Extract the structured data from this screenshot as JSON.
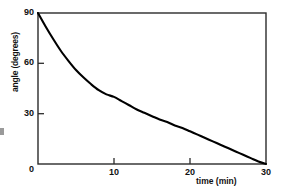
{
  "chart_data": {
    "type": "line",
    "title": "",
    "subtitle": "",
    "xlabel": "time (min)",
    "ylabel": "angle (degrees)",
    "xlim": [
      0,
      30
    ],
    "ylim": [
      0,
      90
    ],
    "xticks": [
      0,
      10,
      20,
      30
    ],
    "xtick_labels": [
      "0",
      "10",
      "20",
      "30"
    ],
    "yticks": [
      0,
      30,
      60,
      90
    ],
    "ytick_labels": [
      "0",
      "30",
      "60",
      "90"
    ],
    "grid": false,
    "legend": null,
    "annotations": [],
    "series": [
      {
        "name": "angle decay",
        "color": "#000000",
        "x": [
          0,
          1,
          2,
          3,
          4,
          5,
          6,
          7,
          8,
          9,
          10,
          11,
          12,
          13,
          14,
          15,
          16,
          17,
          18,
          19,
          20,
          21,
          22,
          23,
          24,
          25,
          26,
          27,
          28,
          29,
          30
        ],
        "y": [
          90.0,
          82.0,
          74.5,
          67.5,
          61.5,
          56.0,
          51.5,
          47.5,
          44.0,
          41.5,
          40.0,
          37.5,
          35.0,
          32.5,
          30.5,
          28.5,
          26.5,
          25.0,
          23.0,
          21.5,
          19.5,
          17.5,
          15.5,
          13.5,
          11.5,
          9.5,
          7.5,
          5.5,
          3.5,
          1.5,
          0.0
        ]
      }
    ]
  },
  "axis": {
    "y_title": "angle (degrees)",
    "x_title": "time (min)",
    "y_tick_90": "90",
    "y_tick_60": "60",
    "y_tick_30": "30",
    "y_tick_0": "0",
    "x_tick_10": "10",
    "x_tick_20": "20",
    "x_tick_30": "30"
  },
  "style": {
    "line_color": "#000000",
    "frame_color": "#2b2b2b",
    "background": "#ffffff"
  }
}
